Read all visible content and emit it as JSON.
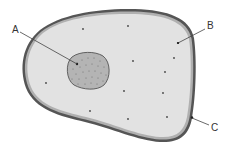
{
  "diagram": {
    "type": "cell-diagram",
    "labels": [
      {
        "id": "A",
        "text": "A",
        "points_to": "nucleus"
      },
      {
        "id": "B",
        "text": "B",
        "points_to": "cytoplasm"
      },
      {
        "id": "C",
        "text": "C",
        "points_to": "cell-membrane"
      }
    ],
    "colors": {
      "cytoplasm": "#e2e2e2",
      "nucleus": "#b4b4b4",
      "membrane_outer": "#555555",
      "membrane_inner": "#b0b0b0",
      "leader_line": "#444444",
      "dots": "#444444"
    }
  }
}
